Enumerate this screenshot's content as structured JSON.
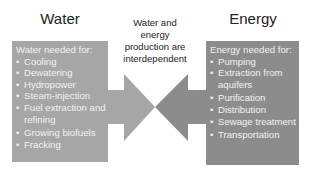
{
  "titles": {
    "water": "Water",
    "energy": "Energy"
  },
  "center_text": [
    "Water and",
    "energy",
    "production are",
    "interdependent"
  ],
  "water_box": {
    "heading": "Water needed for:",
    "items": [
      "Cooling",
      "Dewatering",
      "Hydropower",
      "Steam-injection",
      "Fuel extraction and refining",
      "Growing biofuels",
      "Fracking"
    ]
  },
  "energy_box": {
    "heading": "Energy needed for:",
    "items": [
      "Pumping",
      "Extraction from aquifers",
      "Purification",
      "Distribution",
      "Sewage treatment",
      "Transportation"
    ]
  },
  "bullet_glyph": "•",
  "colors": {
    "water_box": "#a6a6a6",
    "energy_box": "#8c8c8c",
    "water_arrow": "#a6a6a6",
    "energy_arrow": "#8c8c8c",
    "box_text": "#f2f2f2"
  }
}
